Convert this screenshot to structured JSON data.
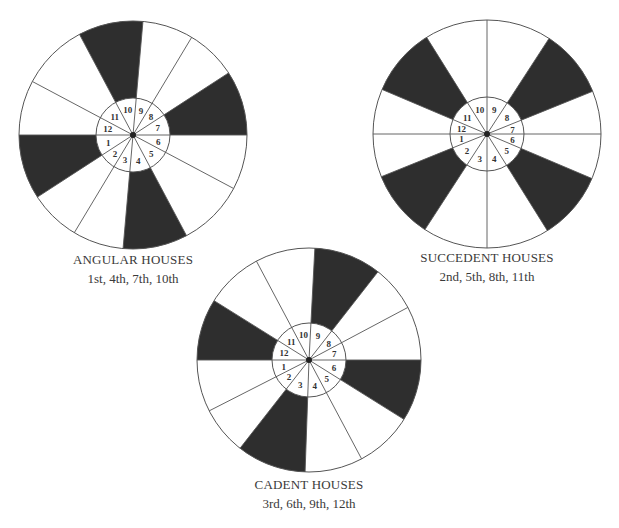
{
  "colors": {
    "filled": "#2e2e2e",
    "empty": "#ffffff",
    "line": "#555555",
    "text": "#333333"
  },
  "wheels": [
    {
      "id": "angular",
      "title": "ANGULAR HOUSES",
      "subtitle": "1st, 4th, 7th, 10th",
      "center": [
        133,
        135
      ],
      "outer_radius": 114,
      "inner_radius": 37,
      "cusps": [
        180,
        213,
        239,
        265,
        298,
        332,
        0,
        33,
        59,
        85,
        118,
        152
      ],
      "highlighted_houses": [
        1,
        4,
        7,
        10
      ],
      "label_pos": [
        133,
        252
      ]
    },
    {
      "id": "succedent",
      "title": "SUCCEDENT HOUSES",
      "subtitle": "2nd, 5th, 8th, 11th",
      "center": [
        487,
        134
      ],
      "outer_radius": 114,
      "inner_radius": 37,
      "cusps": [
        180,
        202,
        237,
        270,
        302,
        337,
        0,
        22,
        57,
        90,
        122,
        157
      ],
      "highlighted_houses": [
        2,
        5,
        8,
        11
      ],
      "label_pos": [
        487,
        250
      ]
    },
    {
      "id": "cadent",
      "title": "CADENT HOUSES",
      "subtitle": "3rd, 6th, 9th, 12th",
      "center": [
        309,
        360
      ],
      "outer_radius": 112,
      "inner_radius": 37,
      "cusps": [
        180,
        207,
        232,
        268,
        298,
        328,
        0,
        28,
        52,
        87,
        118,
        148
      ],
      "highlighted_houses": [
        3,
        6,
        9,
        12
      ],
      "label_pos": [
        309,
        477
      ]
    }
  ],
  "house_numbers": [
    "1",
    "2",
    "3",
    "4",
    "5",
    "6",
    "7",
    "8",
    "9",
    "10",
    "11",
    "12"
  ]
}
